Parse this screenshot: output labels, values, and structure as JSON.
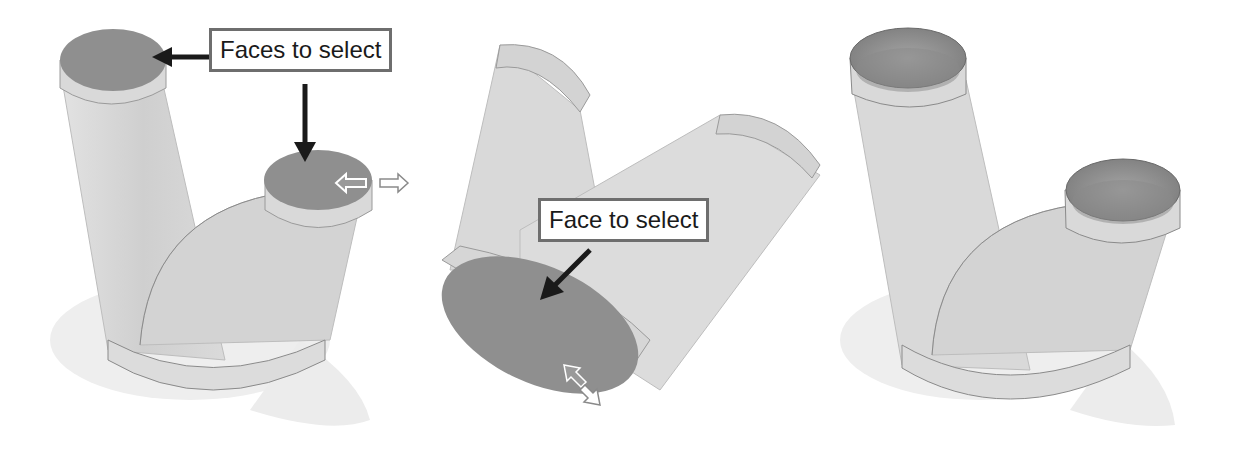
{
  "panels": [
    {
      "id": "before-selection",
      "callout": "Faces to select",
      "callout_targets": [
        "top-left-opening-face",
        "right-opening-face"
      ],
      "cursor": "move-arrow-horizontal"
    },
    {
      "id": "rotated-view",
      "callout": "Face to select",
      "callout_targets": [
        "bottom-opening-face"
      ],
      "cursor": "move-arrow-diagonal"
    },
    {
      "id": "result-hollow",
      "callout": null
    }
  ],
  "colors": {
    "selected_face": "#8f8f8f",
    "body": "#d6d6d6",
    "shadow": "#ececec",
    "callout_border": "#6e6e6e",
    "arrow": "#1a1a1a"
  }
}
